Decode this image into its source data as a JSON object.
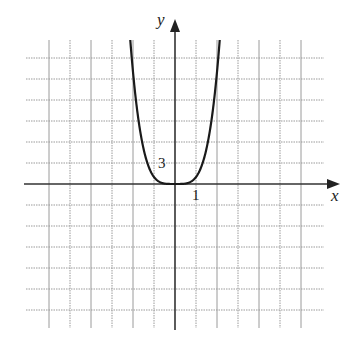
{
  "chart_data": {
    "type": "line",
    "title": "",
    "xlabel": "x",
    "ylabel": "y",
    "function": "y = x^4",
    "x_scale_per_grid": 1,
    "y_scale_per_grid": 3,
    "tick_labels": {
      "x": "1",
      "y": "3"
    },
    "xlim": [
      -7,
      7
    ],
    "ylim": [
      -21,
      21
    ],
    "grid": true,
    "series": [
      {
        "name": "curve",
        "x": [
          -2.2,
          -2.0,
          -1.8,
          -1.5,
          -1.2,
          -1.0,
          -0.8,
          -0.5,
          0,
          0.5,
          0.8,
          1.0,
          1.2,
          1.5,
          1.8,
          2.0,
          2.2
        ],
        "y": [
          23.4,
          16,
          10.5,
          5.06,
          2.07,
          1,
          0.41,
          0.06,
          0,
          0.06,
          0.41,
          1,
          2.07,
          5.06,
          10.5,
          16,
          23.4
        ]
      }
    ]
  },
  "labels": {
    "x_axis": "x",
    "y_axis": "y",
    "x_tick": "1",
    "y_tick": "3"
  },
  "colors": {
    "grid": "#9a9a9a",
    "axis": "#333333",
    "curve": "#1a1a1a"
  }
}
